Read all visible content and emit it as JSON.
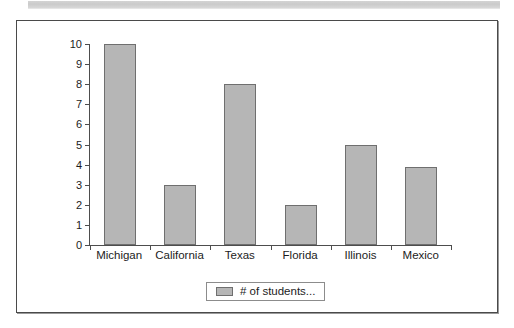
{
  "banner": {
    "name": "scan-artifact-strip"
  },
  "chart_data": {
    "type": "bar",
    "title": "",
    "subtitle": "",
    "xlabel": "",
    "ylabel": "",
    "categories": [
      "Michigan",
      "California",
      "Texas",
      "Florida",
      "Illinois",
      "Mexico"
    ],
    "values": [
      10,
      3,
      8,
      2,
      5,
      3.9
    ],
    "series": [
      {
        "name": "# of students...",
        "values": [
          10,
          3,
          8,
          2,
          5,
          3.9
        ]
      }
    ],
    "ylim": [
      0,
      10
    ],
    "ytick_labels": [
      "10",
      "9",
      "8",
      "7",
      "6",
      "5",
      "4",
      "3",
      "2",
      "1",
      "0"
    ],
    "ytick_values": [
      10,
      9,
      8,
      7,
      6,
      5,
      4,
      3,
      2,
      1,
      0
    ],
    "grid": false,
    "legend": {
      "position": "bottom-center",
      "entries": [
        {
          "label": "# of students...",
          "color": "#b6b6b6"
        }
      ]
    },
    "colors": {
      "bar_fill": "#b6b6b6",
      "bar_stroke": "#6f6f6f",
      "axis": "#4d4d4d",
      "frame": "#4a4a4a",
      "text": "#1c1c1c",
      "background": "#ffffff"
    }
  }
}
